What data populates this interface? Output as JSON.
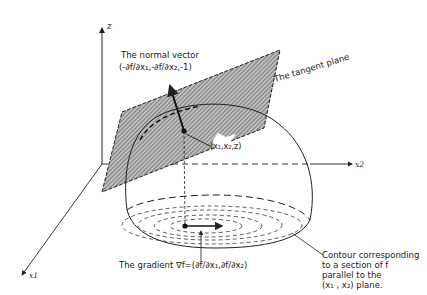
{
  "diagram": {
    "axes": {
      "z": "z",
      "x1": "x1",
      "x2": "x2"
    },
    "labels": {
      "normal_vector_title": "The normal vector",
      "normal_vector_formula": "(-∂f/∂x₁,-∂f/∂x₂,-1)",
      "tangent_plane": "The tangent plane",
      "point": "(x₁,x₂,z)",
      "gradient": "The gradient ∇f=(∂f/∂x₁,∂f/∂x₂)",
      "contour_line1": "Contour corresponding",
      "contour_line2": "to a section of f",
      "contour_line3": "parallel to the",
      "contour_line4": "(x₁ , x₂) plane."
    },
    "colors": {
      "ink": "#222222",
      "hatch": "#555555",
      "background": "#ffffff"
    }
  }
}
